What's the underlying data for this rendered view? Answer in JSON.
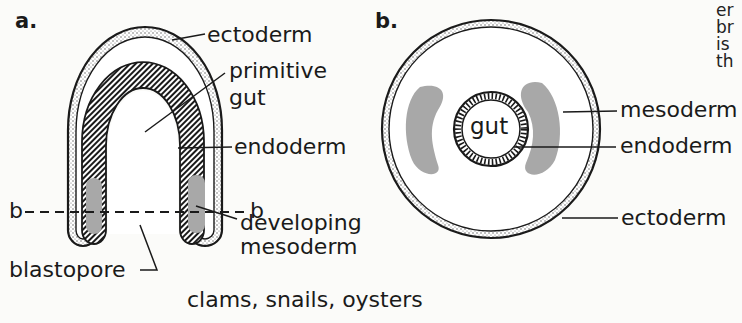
{
  "figure": {
    "panel_a": {
      "letter": "a.",
      "labels": {
        "ectoderm": "ectoderm",
        "primitive_gut_1": "primitive",
        "primitive_gut_2": "gut",
        "endoderm": "endoderm",
        "section_left": "b",
        "section_right": "b",
        "developing_mesoderm_1": "developing",
        "developing_mesoderm_2": "mesoderm",
        "blastopore": "blastopore"
      }
    },
    "panel_b": {
      "letter": "b.",
      "labels": {
        "gut": "gut",
        "mesoderm": "mesoderm",
        "endoderm": "endoderm",
        "ectoderm": "ectoderm"
      }
    },
    "caption": "clams, snails, oysters",
    "side_text_fragments": [
      "er",
      "br",
      "is",
      "th"
    ]
  },
  "colors": {
    "line": "#1a1a1a",
    "mesoderm_fill": "#a8a8a8",
    "background": "#fbfbf9"
  }
}
